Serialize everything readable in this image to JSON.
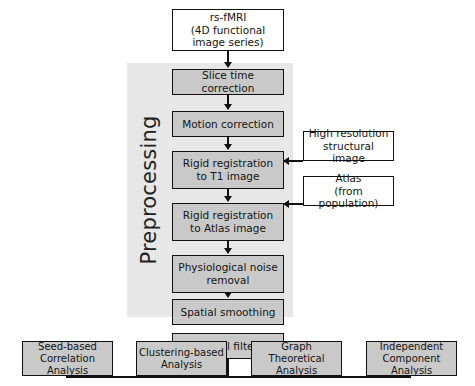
{
  "diagram": {
    "group_label": "Preprocessing",
    "colors": {
      "box_fill_gray": "#c9c9c9",
      "box_fill_white": "#ffffff",
      "band_fill": "#e7e7e7",
      "stroke": "#111111",
      "text": "#141414",
      "background": "#ffffff"
    }
  },
  "source": {
    "line1": "rs-fMRI",
    "line2": "(4D functional",
    "line3": "image series)"
  },
  "pipeline": [
    {
      "line1": "Slice time correction",
      "line2": ""
    },
    {
      "line1": "Motion correction",
      "line2": ""
    },
    {
      "line1": "Rigid registration",
      "line2": "to T1 image"
    },
    {
      "line1": "Rigid registration",
      "line2": "to Atlas image"
    },
    {
      "line1": "Physiological noise",
      "line2": "removal"
    },
    {
      "line1": "Spatial smoothing",
      "line2": ""
    },
    {
      "line1": "Temporal filtering",
      "line2": ""
    }
  ],
  "inputs": [
    {
      "line1": "High resolution",
      "line2": "structural image"
    },
    {
      "line1": "Atlas",
      "line2": "(from population)"
    }
  ],
  "analyses": [
    {
      "line1": "Seed-based",
      "line2": "Correlation Analysis"
    },
    {
      "line1": "Clustering-based",
      "line2": "Analysis"
    },
    {
      "line1": "Graph Theoretical",
      "line2": "Analysis"
    },
    {
      "line1": "Independent",
      "line2": "Component Analysis"
    }
  ]
}
